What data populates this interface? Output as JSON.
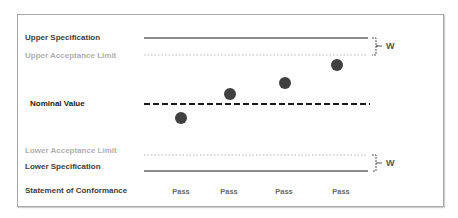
{
  "labels": {
    "upper_spec": "Upper Specification",
    "upper_acceptance": "Upper Acceptance Limit",
    "nominal": "Nominal Value",
    "lower_acceptance": "Lower Acceptance Limit",
    "lower_spec": "Lower Specification",
    "statement": "Statement of Conformance"
  },
  "guard_band": {
    "upper_label": "W",
    "lower_label": "W"
  },
  "measurements": [
    {
      "x": 181,
      "y": 118,
      "result": "Pass"
    },
    {
      "x": 230,
      "y": 94,
      "result": "Pass"
    },
    {
      "x": 285,
      "y": 83,
      "result": "Pass"
    },
    {
      "x": 337,
      "y": 65,
      "result": "Pass"
    }
  ],
  "colors": {
    "spec_line": "#8c8c8c",
    "acceptance_line": "#b8b8b8",
    "nominal_line": "#1a1a1a",
    "dot": "#404040"
  }
}
